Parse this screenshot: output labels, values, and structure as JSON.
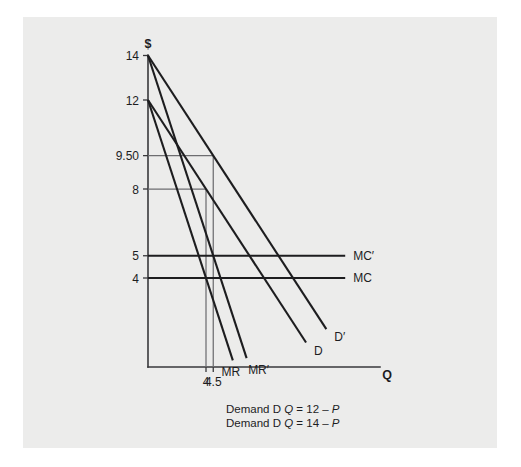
{
  "figure": {
    "axis_y_label": "$",
    "axis_x_label": "Q",
    "background_color": "#ececeb",
    "line_color": "#1d1d1f",
    "guide_color": "#6d6d70"
  },
  "caption": {
    "line1_prefix": "Demand D ",
    "line1_var": "Q",
    "line1_equation": " = 12 – ",
    "line1_price": "P",
    "line2_prefix": "Demand D ",
    "line2_var": "Q",
    "line2_equation": " = 14 – ",
    "line2_price": "P"
  },
  "chart_data": {
    "type": "line",
    "title": "",
    "xlabel": "Q",
    "ylabel": "$",
    "xlim": [
      0,
      16
    ],
    "ylim": [
      0,
      15
    ],
    "grid": false,
    "legend": "inline-curve-labels",
    "y_ticks": [
      {
        "value": 14,
        "label": "14"
      },
      {
        "value": 12,
        "label": "12"
      },
      {
        "value": 9.5,
        "label": "9.50"
      },
      {
        "value": 8,
        "label": "8"
      },
      {
        "value": 5,
        "label": "5"
      },
      {
        "value": 4,
        "label": "4"
      }
    ],
    "x_ticks": [
      {
        "value": 4,
        "label": "4"
      },
      {
        "value": 4.5,
        "label": "4.5"
      }
    ],
    "series": [
      {
        "name": "D",
        "label": "D",
        "type": "demand",
        "equation": "Q = 12 - P",
        "points": [
          [
            0,
            12
          ],
          [
            12,
            0
          ]
        ],
        "draw_to": [
          10.9,
          1.1
        ]
      },
      {
        "name": "D'",
        "label": "D′",
        "type": "demand",
        "equation": "Q = 14 - P",
        "points": [
          [
            0,
            14
          ],
          [
            14,
            0
          ]
        ],
        "draw_to": [
          12.3,
          1.7
        ]
      },
      {
        "name": "MR",
        "label": "MR",
        "type": "marginal-revenue",
        "equation": "MR = 12 - 2Q",
        "points": [
          [
            0,
            12
          ],
          [
            6,
            0
          ]
        ],
        "draw_to": [
          5.85,
          0.3
        ]
      },
      {
        "name": "MR'",
        "label": "MR′",
        "type": "marginal-revenue",
        "equation": "MR' = 14 - 2Q",
        "points": [
          [
            0,
            14
          ],
          [
            7,
            0
          ]
        ],
        "draw_to": [
          6.8,
          0.4
        ]
      },
      {
        "name": "MC",
        "label": "MC",
        "type": "marginal-cost",
        "equation": "MC = 4",
        "points": [
          [
            0,
            4
          ],
          [
            13.6,
            4
          ]
        ]
      },
      {
        "name": "MC'",
        "label": "MC′",
        "type": "marginal-cost",
        "equation": "MC' = 5",
        "points": [
          [
            0,
            5
          ],
          [
            13.6,
            5
          ]
        ]
      }
    ],
    "equilibria": [
      {
        "quantity": 4,
        "price": 8,
        "label": "D with MC"
      },
      {
        "quantity": 4.5,
        "price": 9.5,
        "label": "D' with MC'"
      }
    ],
    "guide_lines": [
      {
        "price": 9.5,
        "quantity": 4.5
      },
      {
        "price": 8,
        "quantity": 4
      }
    ]
  }
}
